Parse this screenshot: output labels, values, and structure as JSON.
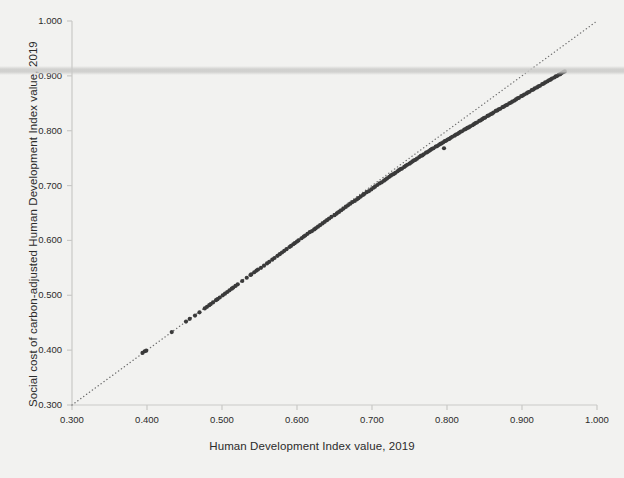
{
  "chart_data": {
    "type": "scatter",
    "title": "",
    "xlabel": "Human Development Index value, 2019",
    "ylabel": "Social cost of carbon-adjusted Human Development Index value, 2019",
    "xlim": [
      0.3,
      1.0
    ],
    "ylim": [
      0.3,
      1.0
    ],
    "xticks": [
      "0.300",
      "0.400",
      "0.500",
      "0.600",
      "0.700",
      "0.800",
      "0.900",
      "1.000"
    ],
    "yticks": [
      "0.300",
      "0.400",
      "0.500",
      "0.600",
      "0.700",
      "0.800",
      "0.900",
      "1.000"
    ],
    "xtick_values": [
      0.3,
      0.4,
      0.5,
      0.6,
      0.7,
      0.8,
      0.9,
      1.0
    ],
    "ytick_values": [
      0.3,
      0.4,
      0.5,
      0.6,
      0.7,
      0.8,
      0.9,
      1.0
    ],
    "grid": false,
    "legend": "none",
    "marker_color": "#3a3a3a",
    "marker_size": 4.2,
    "reference_line": {
      "style": "dotted",
      "color": "#6f6f6f",
      "from": [
        0.3,
        0.3
      ],
      "to": [
        1.0,
        1.0
      ],
      "label": ""
    },
    "points": [
      [
        0.394,
        0.395
      ],
      [
        0.397,
        0.398
      ],
      [
        0.399,
        0.399
      ],
      [
        0.433,
        0.433
      ],
      [
        0.452,
        0.452
      ],
      [
        0.457,
        0.457
      ],
      [
        0.464,
        0.463
      ],
      [
        0.47,
        0.469
      ],
      [
        0.477,
        0.476
      ],
      [
        0.48,
        0.479
      ],
      [
        0.483,
        0.482
      ],
      [
        0.485,
        0.484
      ],
      [
        0.488,
        0.487
      ],
      [
        0.492,
        0.491
      ],
      [
        0.494,
        0.493
      ],
      [
        0.497,
        0.496
      ],
      [
        0.501,
        0.5
      ],
      [
        0.504,
        0.503
      ],
      [
        0.507,
        0.506
      ],
      [
        0.51,
        0.509
      ],
      [
        0.513,
        0.512
      ],
      [
        0.515,
        0.514
      ],
      [
        0.518,
        0.517
      ],
      [
        0.521,
        0.52
      ],
      [
        0.527,
        0.526
      ],
      [
        0.533,
        0.532
      ],
      [
        0.538,
        0.537
      ],
      [
        0.539,
        0.538
      ],
      [
        0.543,
        0.542
      ],
      [
        0.546,
        0.545
      ],
      [
        0.548,
        0.547
      ],
      [
        0.552,
        0.55
      ],
      [
        0.556,
        0.554
      ],
      [
        0.56,
        0.558
      ],
      [
        0.563,
        0.561
      ],
      [
        0.567,
        0.565
      ],
      [
        0.57,
        0.568
      ],
      [
        0.574,
        0.572
      ],
      [
        0.577,
        0.575
      ],
      [
        0.58,
        0.578
      ],
      [
        0.583,
        0.581
      ],
      [
        0.586,
        0.584
      ],
      [
        0.59,
        0.588
      ],
      [
        0.592,
        0.59
      ],
      [
        0.595,
        0.593
      ],
      [
        0.597,
        0.595
      ],
      [
        0.6,
        0.598
      ],
      [
        0.602,
        0.6
      ],
      [
        0.606,
        0.604
      ],
      [
        0.609,
        0.607
      ],
      [
        0.611,
        0.609
      ],
      [
        0.614,
        0.612
      ],
      [
        0.617,
        0.615
      ],
      [
        0.62,
        0.617
      ],
      [
        0.623,
        0.62
      ],
      [
        0.625,
        0.622
      ],
      [
        0.628,
        0.625
      ],
      [
        0.631,
        0.628
      ],
      [
        0.634,
        0.631
      ],
      [
        0.637,
        0.634
      ],
      [
        0.64,
        0.637
      ],
      [
        0.643,
        0.64
      ],
      [
        0.646,
        0.643
      ],
      [
        0.65,
        0.646
      ],
      [
        0.653,
        0.649
      ],
      [
        0.656,
        0.652
      ],
      [
        0.659,
        0.655
      ],
      [
        0.662,
        0.658
      ],
      [
        0.665,
        0.661
      ],
      [
        0.668,
        0.664
      ],
      [
        0.671,
        0.667
      ],
      [
        0.674,
        0.67
      ],
      [
        0.677,
        0.672
      ],
      [
        0.68,
        0.675
      ],
      [
        0.682,
        0.677
      ],
      [
        0.685,
        0.68
      ],
      [
        0.688,
        0.683
      ],
      [
        0.69,
        0.685
      ],
      [
        0.693,
        0.688
      ],
      [
        0.696,
        0.69
      ],
      [
        0.699,
        0.693
      ],
      [
        0.702,
        0.696
      ],
      [
        0.704,
        0.698
      ],
      [
        0.707,
        0.701
      ],
      [
        0.71,
        0.704
      ],
      [
        0.713,
        0.706
      ],
      [
        0.716,
        0.709
      ],
      [
        0.718,
        0.711
      ],
      [
        0.72,
        0.713
      ],
      [
        0.723,
        0.716
      ],
      [
        0.725,
        0.718
      ],
      [
        0.727,
        0.72
      ],
      [
        0.729,
        0.721
      ],
      [
        0.731,
        0.723
      ],
      [
        0.734,
        0.726
      ],
      [
        0.736,
        0.728
      ],
      [
        0.738,
        0.73
      ],
      [
        0.74,
        0.731
      ],
      [
        0.743,
        0.734
      ],
      [
        0.745,
        0.736
      ],
      [
        0.747,
        0.738
      ],
      [
        0.75,
        0.74
      ],
      [
        0.752,
        0.742
      ],
      [
        0.754,
        0.744
      ],
      [
        0.756,
        0.746
      ],
      [
        0.758,
        0.747
      ],
      [
        0.76,
        0.749
      ],
      [
        0.763,
        0.752
      ],
      [
        0.765,
        0.754
      ],
      [
        0.767,
        0.755
      ],
      [
        0.769,
        0.757
      ],
      [
        0.772,
        0.76
      ],
      [
        0.774,
        0.761
      ],
      [
        0.776,
        0.763
      ],
      [
        0.778,
        0.765
      ],
      [
        0.78,
        0.767
      ],
      [
        0.782,
        0.768
      ],
      [
        0.785,
        0.771
      ],
      [
        0.787,
        0.772
      ],
      [
        0.789,
        0.774
      ],
      [
        0.791,
        0.776
      ],
      [
        0.793,
        0.777
      ],
      [
        0.795,
        0.779
      ],
      [
        0.796,
        0.768
      ],
      [
        0.797,
        0.781
      ],
      [
        0.799,
        0.782
      ],
      [
        0.801,
        0.784
      ],
      [
        0.803,
        0.785
      ],
      [
        0.805,
        0.787
      ],
      [
        0.807,
        0.789
      ],
      [
        0.81,
        0.791
      ],
      [
        0.812,
        0.793
      ],
      [
        0.814,
        0.794
      ],
      [
        0.816,
        0.796
      ],
      [
        0.818,
        0.798
      ],
      [
        0.82,
        0.799
      ],
      [
        0.823,
        0.802
      ],
      [
        0.825,
        0.803
      ],
      [
        0.827,
        0.805
      ],
      [
        0.829,
        0.806
      ],
      [
        0.831,
        0.808
      ],
      [
        0.834,
        0.81
      ],
      [
        0.836,
        0.812
      ],
      [
        0.838,
        0.814
      ],
      [
        0.84,
        0.815
      ],
      [
        0.843,
        0.818
      ],
      [
        0.845,
        0.819
      ],
      [
        0.847,
        0.821
      ],
      [
        0.849,
        0.823
      ],
      [
        0.851,
        0.824
      ],
      [
        0.854,
        0.827
      ],
      [
        0.856,
        0.828
      ],
      [
        0.858,
        0.83
      ],
      [
        0.86,
        0.831
      ],
      [
        0.862,
        0.833
      ],
      [
        0.865,
        0.836
      ],
      [
        0.867,
        0.837
      ],
      [
        0.869,
        0.839
      ],
      [
        0.871,
        0.84
      ],
      [
        0.874,
        0.843
      ],
      [
        0.876,
        0.844
      ],
      [
        0.878,
        0.846
      ],
      [
        0.88,
        0.847
      ],
      [
        0.883,
        0.85
      ],
      [
        0.885,
        0.851
      ],
      [
        0.887,
        0.853
      ],
      [
        0.89,
        0.855
      ],
      [
        0.892,
        0.857
      ],
      [
        0.894,
        0.859
      ],
      [
        0.896,
        0.86
      ],
      [
        0.899,
        0.863
      ],
      [
        0.901,
        0.864
      ],
      [
        0.903,
        0.866
      ],
      [
        0.906,
        0.868
      ],
      [
        0.908,
        0.87
      ],
      [
        0.91,
        0.871
      ],
      [
        0.913,
        0.874
      ],
      [
        0.915,
        0.875
      ],
      [
        0.917,
        0.877
      ],
      [
        0.92,
        0.879
      ],
      [
        0.922,
        0.881
      ],
      [
        0.924,
        0.882
      ],
      [
        0.927,
        0.885
      ],
      [
        0.929,
        0.886
      ],
      [
        0.931,
        0.888
      ],
      [
        0.934,
        0.89
      ],
      [
        0.936,
        0.892
      ],
      [
        0.938,
        0.893
      ],
      [
        0.94,
        0.895
      ],
      [
        0.943,
        0.897
      ],
      [
        0.945,
        0.899
      ],
      [
        0.947,
        0.9
      ],
      [
        0.949,
        0.902
      ],
      [
        0.951,
        0.903
      ],
      [
        0.953,
        0.905
      ],
      [
        0.955,
        0.907
      ],
      [
        0.957,
        0.908
      ]
    ]
  },
  "figure": {
    "background_color": "#f2f2f0",
    "axis_color": "#c9c9c7",
    "text_color": "#2b2b2b"
  }
}
